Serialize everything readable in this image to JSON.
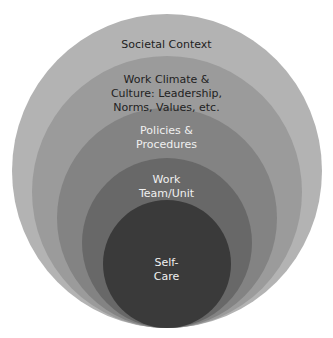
{
  "diagram": {
    "type": "nested-circles",
    "layers": [
      {
        "label": "Societal Context",
        "color": "#b3b3b3",
        "text_color": "#222222"
      },
      {
        "label": "Work Climate &\nCulture: Leadership,\nNorms, Values, etc.",
        "color": "#9b9b9b",
        "text_color": "#222222"
      },
      {
        "label": "Policies &\nProcedures",
        "color": "#838383",
        "text_color": "#f0f0f0"
      },
      {
        "label": "Work\nTeam/Unit",
        "color": "#686868",
        "text_color": "#f0f0f0"
      },
      {
        "label": "Self-\nCare",
        "color": "#3a3a3a",
        "text_color": "#f0f0f0"
      }
    ]
  }
}
